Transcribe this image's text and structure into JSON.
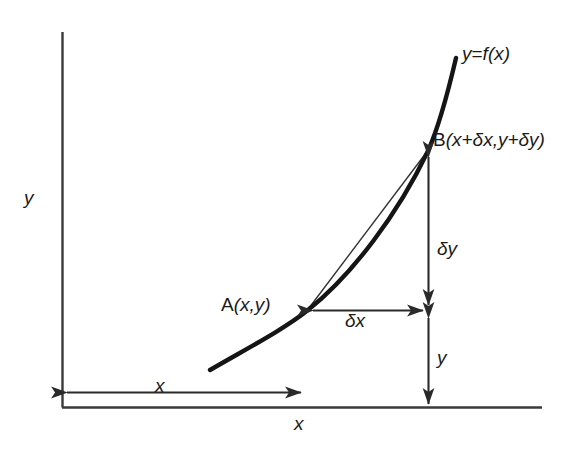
{
  "figure": {
    "background_color": "#ffffff",
    "ink_color": "#1a1a1a",
    "axes": {
      "y_axis_label": "y",
      "x_axis_label": "x",
      "origin": [
        62,
        407
      ],
      "y_axis_top": [
        62,
        32
      ],
      "x_axis_right": [
        542,
        407
      ]
    },
    "curve": {
      "label": "y=f(x)",
      "label_y": "y",
      "label_equals": "=",
      "label_f": "f",
      "label_of_x": "(x)",
      "stroke_width": 4.2,
      "start": [
        210,
        370
      ],
      "end": [
        456,
        58
      ]
    },
    "chord": {
      "name": "chord-AB",
      "stroke_width": 1.3,
      "from": [
        308,
        310
      ],
      "to": [
        428,
        151
      ]
    },
    "points": [
      {
        "name": "point-A",
        "label": "A(x,y)",
        "label_letter": "A",
        "label_coords": "(x,y)",
        "x": 308,
        "y": 310
      },
      {
        "name": "point-B",
        "label": "B(x+δx,y+δy)",
        "label_letter": "B",
        "label_coords": "(x+δx,y+δy)",
        "x": 428,
        "y": 151
      }
    ],
    "measurements": [
      {
        "name": "delta-x",
        "label": "δx",
        "orientation": "horizontal",
        "from": [
          308,
          310
        ],
        "to": [
          428,
          310
        ]
      },
      {
        "name": "delta-y",
        "label": "δy",
        "orientation": "vertical",
        "from": [
          428,
          151
        ],
        "to": [
          428,
          310
        ]
      },
      {
        "name": "y-value",
        "label": "y",
        "orientation": "vertical",
        "from": [
          428,
          318
        ],
        "to": [
          428,
          407
        ]
      },
      {
        "name": "x-value",
        "label": "x",
        "orientation": "horizontal",
        "from": [
          64,
          392
        ],
        "to": [
          306,
          392
        ]
      }
    ]
  }
}
